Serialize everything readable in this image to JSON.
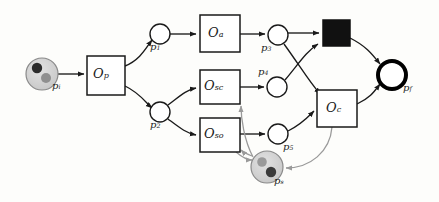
{
  "diagram": {
    "type": "petri-net",
    "background_color": "#fdfdfb",
    "stroke_color": "#1a1a1a",
    "token_place_fill": "#d0d0d0",
    "resource_arc_color": "#9a9a9a",
    "final_place_stroke": "#000000"
  },
  "places": [
    {
      "id": "pi",
      "label": "p",
      "sub": "i",
      "kind": "token-place",
      "cx": 42,
      "cy": 74,
      "r": 16,
      "label_x": 52,
      "label_y": 86,
      "tokens": [
        {
          "dx": -5,
          "dy": -6,
          "r": 5.2,
          "color": "#2b2b2b"
        },
        {
          "dx": 4,
          "dy": 4,
          "r": 5.0,
          "color": "#8f8f8f"
        }
      ]
    },
    {
      "id": "p1",
      "label": "p",
      "sub": "1",
      "kind": "place",
      "cx": 160,
      "cy": 34,
      "r": 10,
      "label_x": 150,
      "label_y": 46
    },
    {
      "id": "p2",
      "label": "p",
      "sub": "2",
      "kind": "place",
      "cx": 160,
      "cy": 112,
      "r": 10,
      "label_x": 150,
      "label_y": 124
    },
    {
      "id": "p3",
      "label": "p",
      "sub": "3",
      "kind": "place",
      "cx": 278,
      "cy": 35,
      "r": 10,
      "label_x": 262,
      "label_y": 47
    },
    {
      "id": "p4",
      "label": "p",
      "sub": "4",
      "kind": "place",
      "cx": 277,
      "cy": 87,
      "r": 10,
      "label_x": 259,
      "label_y": 73
    },
    {
      "id": "p5",
      "label": "p",
      "sub": "5",
      "kind": "place",
      "cx": 278,
      "cy": 134,
      "r": 10,
      "label_x": 282,
      "label_y": 148
    },
    {
      "id": "ps",
      "label": "p",
      "sub": "s",
      "kind": "token-place",
      "cx": 267,
      "cy": 167,
      "r": 16,
      "label_x": 275,
      "label_y": 180,
      "tokens": [
        {
          "dx": -5,
          "dy": -5,
          "r": 4.8,
          "color": "#9a9a9a"
        },
        {
          "dx": 4,
          "dy": 5,
          "r": 5.2,
          "color": "#3a3a3a"
        }
      ]
    },
    {
      "id": "pf",
      "label": "p",
      "sub": "f",
      "kind": "final-place",
      "cx": 392,
      "cy": 75,
      "r": 14,
      "label_x": 404,
      "label_y": 89
    }
  ],
  "transitions": [
    {
      "id": "Op",
      "label": "O",
      "sub": "p",
      "kind": "box",
      "x": 87,
      "y": 56,
      "w": 38,
      "h": 39
    },
    {
      "id": "Oa",
      "label": "O",
      "sub": "a",
      "kind": "box",
      "x": 200,
      "y": 15,
      "w": 40,
      "h": 37
    },
    {
      "id": "Osc",
      "label": "O",
      "sub": "sc",
      "kind": "box",
      "x": 200,
      "y": 70,
      "w": 40,
      "h": 34
    },
    {
      "id": "Oso",
      "label": "O",
      "sub": "so",
      "kind": "box",
      "x": 200,
      "y": 118,
      "w": 40,
      "h": 34
    },
    {
      "id": "Tsync",
      "label": "",
      "sub": "",
      "kind": "filled-box",
      "x": 323,
      "y": 20,
      "w": 27,
      "h": 26
    },
    {
      "id": "Oc",
      "label": "O",
      "sub": "c",
      "kind": "box",
      "x": 317,
      "y": 90,
      "w": 40,
      "h": 37
    }
  ],
  "arcs": [
    {
      "from": "pi",
      "to": "Op",
      "style": "solid"
    },
    {
      "from": "Op",
      "to": "p1",
      "style": "solid"
    },
    {
      "from": "Op",
      "to": "p2",
      "style": "solid"
    },
    {
      "from": "p1",
      "to": "Oa",
      "style": "solid"
    },
    {
      "from": "p2",
      "to": "Osc",
      "style": "solid"
    },
    {
      "from": "p2",
      "to": "Oso",
      "style": "solid"
    },
    {
      "from": "Oa",
      "to": "p3",
      "style": "solid"
    },
    {
      "from": "Osc",
      "to": "p4",
      "style": "solid"
    },
    {
      "from": "Oso",
      "to": "p5",
      "style": "solid"
    },
    {
      "from": "p3",
      "to": "Tsync",
      "style": "solid"
    },
    {
      "from": "p4",
      "to": "Tsync",
      "style": "solid"
    },
    {
      "from": "p3",
      "to": "Oc",
      "style": "solid"
    },
    {
      "from": "p5",
      "to": "Oc",
      "style": "solid"
    },
    {
      "from": "Tsync",
      "to": "pf",
      "style": "solid"
    },
    {
      "from": "Oc",
      "to": "pf",
      "style": "solid"
    },
    {
      "from": "Oso",
      "to": "ps",
      "style": "resource"
    },
    {
      "from": "ps",
      "to": "Osc",
      "style": "resource"
    },
    {
      "from": "ps",
      "to": "Oso",
      "style": "resource"
    },
    {
      "from": "Oc",
      "to": "ps",
      "style": "resource"
    }
  ]
}
